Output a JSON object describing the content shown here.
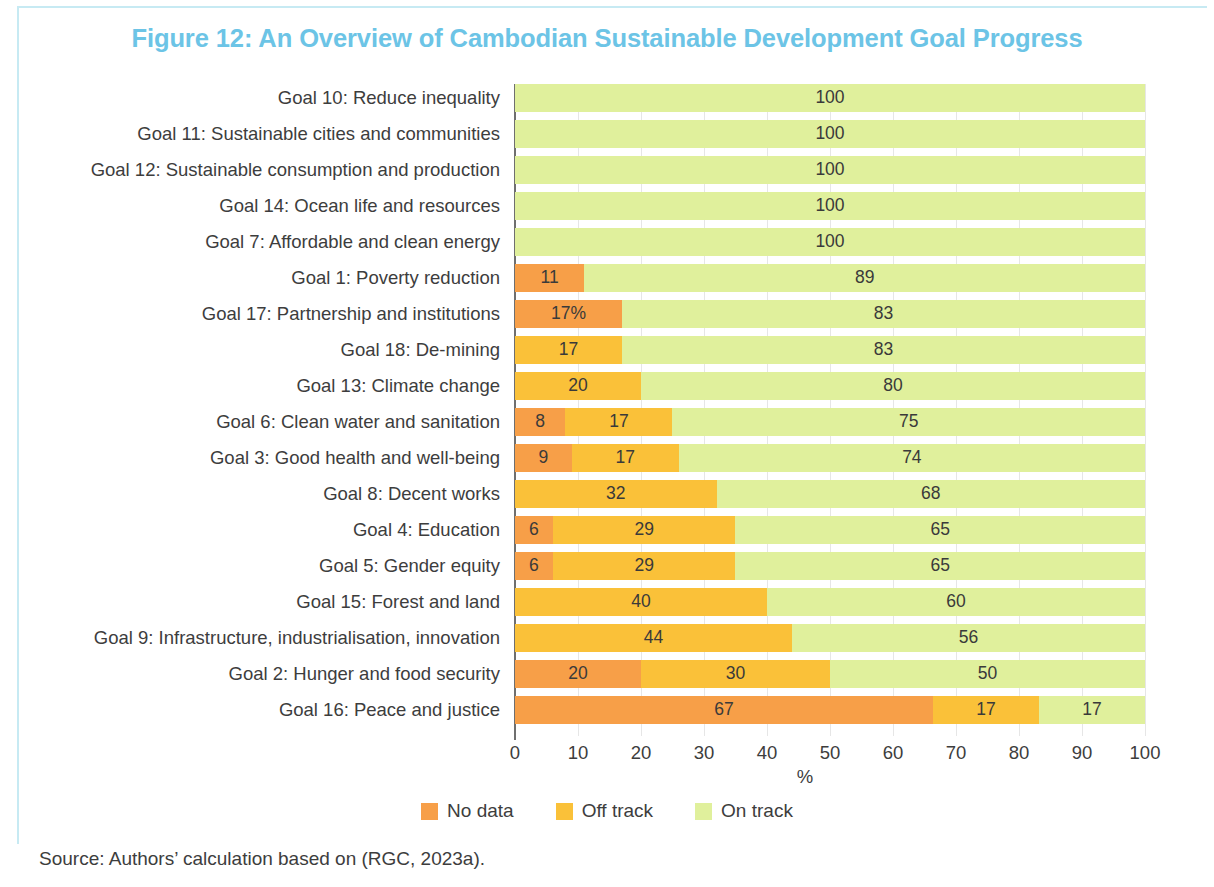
{
  "figure": {
    "title": "Figure 12: An Overview of Cambodian Sustainable Development Goal Progress",
    "title_color": "#6cc4e6",
    "source": "Source: Authors’ calculation based on (RGC, 2023a)."
  },
  "legend": {
    "items": [
      {
        "label": "No data",
        "color": "#f79f48"
      },
      {
        "label": "Off track",
        "color": "#fac139"
      },
      {
        "label": "On track",
        "color": "#e0f09c"
      }
    ]
  },
  "axis": {
    "xlabel": "%",
    "ticks": [
      "0",
      "10",
      "20",
      "30",
      "40",
      "50",
      "60",
      "70",
      "80",
      "90",
      "100"
    ]
  },
  "chart_data": {
    "type": "bar",
    "orientation": "horizontal",
    "stacked": true,
    "title": "Figure 12: An Overview of Cambodian Sustainable Development Goal Progress",
    "xlabel": "%",
    "ylabel": "",
    "xlim": [
      0,
      100
    ],
    "xticks": [
      0,
      10,
      20,
      30,
      40,
      50,
      60,
      70,
      80,
      90,
      100
    ],
    "grid": "vertical",
    "legend_position": "bottom",
    "series": [
      {
        "name": "No data",
        "color": "#f79f48"
      },
      {
        "name": "Off track",
        "color": "#fac139"
      },
      {
        "name": "On track",
        "color": "#e0f09c"
      }
    ],
    "categories": [
      "Goal 10: Reduce inequality",
      "Goal 11: Sustainable cities and communities",
      "Goal 12: Sustainable consumption and production",
      "Goal 14: Ocean life and resources",
      "Goal 7: Affordable and clean energy",
      "Goal 1: Poverty reduction",
      "Goal 17: Partnership and institutions",
      "Goal 18: De-mining",
      "Goal 13: Climate change",
      "Goal 6: Clean water and sanitation",
      "Goal 3: Good health and well-being",
      "Goal 8: Decent works",
      "Goal 4: Education",
      "Goal 5: Gender equity",
      "Goal 15: Forest and land",
      "Goal 9: Infrastructure, industrialisation, innovation",
      "Goal 2: Hunger and food security",
      "Goal 16: Peace and justice"
    ],
    "rows": [
      {
        "category": "Goal 10: Reduce inequality",
        "no_data": 0,
        "off_track": 0,
        "on_track": 100,
        "labels": {
          "no_data": "",
          "off_track": "",
          "on_track": "100"
        }
      },
      {
        "category": "Goal 11: Sustainable cities and communities",
        "no_data": 0,
        "off_track": 0,
        "on_track": 100,
        "labels": {
          "no_data": "",
          "off_track": "",
          "on_track": "100"
        }
      },
      {
        "category": "Goal 12: Sustainable consumption and production",
        "no_data": 0,
        "off_track": 0,
        "on_track": 100,
        "labels": {
          "no_data": "",
          "off_track": "",
          "on_track": "100"
        }
      },
      {
        "category": "Goal 14: Ocean life and resources",
        "no_data": 0,
        "off_track": 0,
        "on_track": 100,
        "labels": {
          "no_data": "",
          "off_track": "",
          "on_track": "100"
        }
      },
      {
        "category": "Goal 7: Affordable and clean energy",
        "no_data": 0,
        "off_track": 0,
        "on_track": 100,
        "labels": {
          "no_data": "",
          "off_track": "",
          "on_track": "100"
        }
      },
      {
        "category": "Goal 1: Poverty reduction",
        "no_data": 11,
        "off_track": 0,
        "on_track": 89,
        "labels": {
          "no_data": "11",
          "off_track": "",
          "on_track": "89"
        }
      },
      {
        "category": "Goal 17: Partnership and institutions",
        "no_data": 17,
        "off_track": 0,
        "on_track": 83,
        "labels": {
          "no_data": "17%",
          "off_track": "",
          "on_track": "83"
        }
      },
      {
        "category": "Goal 18: De-mining",
        "no_data": 0,
        "off_track": 17,
        "on_track": 83,
        "labels": {
          "no_data": "",
          "off_track": "17",
          "on_track": "83"
        }
      },
      {
        "category": "Goal 13: Climate change",
        "no_data": 0,
        "off_track": 20,
        "on_track": 80,
        "labels": {
          "no_data": "",
          "off_track": "20",
          "on_track": "80"
        }
      },
      {
        "category": "Goal 6: Clean water and sanitation",
        "no_data": 8,
        "off_track": 17,
        "on_track": 75,
        "labels": {
          "no_data": "8",
          "off_track": "17",
          "on_track": "75"
        }
      },
      {
        "category": "Goal 3: Good health and well-being",
        "no_data": 9,
        "off_track": 17,
        "on_track": 74,
        "labels": {
          "no_data": "9",
          "off_track": "17",
          "on_track": "74"
        }
      },
      {
        "category": "Goal 8: Decent works",
        "no_data": 0,
        "off_track": 32,
        "on_track": 68,
        "labels": {
          "no_data": "",
          "off_track": "32",
          "on_track": "68"
        }
      },
      {
        "category": "Goal 4: Education",
        "no_data": 6,
        "off_track": 29,
        "on_track": 65,
        "labels": {
          "no_data": "6",
          "off_track": "29",
          "on_track": "65"
        }
      },
      {
        "category": "Goal 5: Gender equity",
        "no_data": 6,
        "off_track": 29,
        "on_track": 65,
        "labels": {
          "no_data": "6",
          "off_track": "29",
          "on_track": "65"
        }
      },
      {
        "category": "Goal 15: Forest and land",
        "no_data": 0,
        "off_track": 40,
        "on_track": 60,
        "labels": {
          "no_data": "",
          "off_track": "40",
          "on_track": "60"
        }
      },
      {
        "category": "Goal 9: Infrastructure, industrialisation, innovation",
        "no_data": 0,
        "off_track": 44,
        "on_track": 56,
        "labels": {
          "no_data": "",
          "off_track": "44",
          "on_track": "56"
        }
      },
      {
        "category": "Goal 2: Hunger and food security",
        "no_data": 20,
        "off_track": 30,
        "on_track": 50,
        "labels": {
          "no_data": "20",
          "off_track": "30",
          "on_track": "50"
        }
      },
      {
        "category": "Goal 16: Peace and justice",
        "no_data": 67,
        "off_track": 17,
        "on_track": 17,
        "labels": {
          "no_data": "67",
          "off_track": "17",
          "on_track": "17"
        }
      }
    ]
  }
}
